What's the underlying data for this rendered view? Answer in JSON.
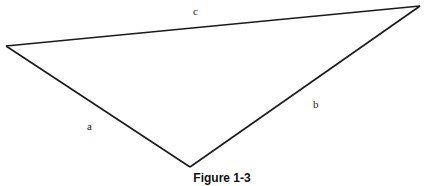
{
  "figure": {
    "caption": "Figure 1-3",
    "shape": "triangle",
    "line_color": "#1a1a1a",
    "sides": [
      {
        "id": "a",
        "label": "a",
        "between": [
          "left-vertex",
          "bottom-vertex"
        ]
      },
      {
        "id": "b",
        "label": "b",
        "between": [
          "bottom-vertex",
          "right-vertex"
        ]
      },
      {
        "id": "c",
        "label": "c",
        "between": [
          "left-vertex",
          "right-vertex"
        ]
      }
    ]
  }
}
